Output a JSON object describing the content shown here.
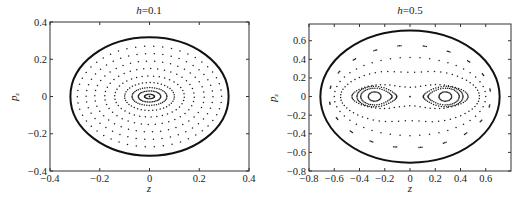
{
  "chart_data": [
    {
      "type": "scatter",
      "title": "h=0.1",
      "title_prefix": "h",
      "title_value": "=0.1",
      "xlabel": "z",
      "ylabel": "p_z",
      "xlim": [
        -0.4,
        0.4
      ],
      "ylim": [
        -0.4,
        0.4
      ],
      "xticks": [
        -0.4,
        -0.2,
        0,
        0.2,
        0.4
      ],
      "xtick_labels": [
        "−0.4",
        "−0.2",
        "0",
        "0.2",
        "0.4"
      ],
      "yticks": [
        -0.4,
        -0.2,
        0,
        0.2,
        0.4
      ],
      "ytick_labels": [
        "−0.4",
        "−0.2",
        "0",
        "0.2",
        "0.4"
      ],
      "grid": false,
      "legend": null,
      "frame_px": {
        "x0": 50,
        "y0": 22,
        "x1": 249,
        "y1": 171
      },
      "boundary": {
        "cz": 0,
        "cp": 0,
        "rz": 0.318,
        "rp": 0.318
      },
      "orbits": [
        {
          "kind": "ring",
          "cz": 0,
          "cp": 0,
          "rz": 0.02,
          "rp": 0.012,
          "n": 24
        },
        {
          "kind": "ring",
          "cz": 0,
          "cp": 0,
          "rz": 0.045,
          "rp": 0.03,
          "n": 40
        },
        {
          "kind": "ring",
          "cz": 0,
          "cp": 0,
          "rz": 0.07,
          "rp": 0.048,
          "n": 44
        },
        {
          "kind": "ring",
          "cz": 0,
          "cp": 0,
          "rz": 0.1,
          "rp": 0.075,
          "n": 40
        },
        {
          "kind": "ring",
          "cz": 0,
          "cp": 0,
          "rz": 0.14,
          "rp": 0.11,
          "n": 38
        },
        {
          "kind": "ring",
          "cz": 0,
          "cp": 0,
          "rz": 0.18,
          "rp": 0.15,
          "n": 40
        },
        {
          "kind": "ring",
          "cz": 0,
          "cp": 0,
          "rz": 0.22,
          "rp": 0.19,
          "n": 42
        },
        {
          "kind": "ring",
          "cz": 0,
          "cp": 0,
          "rz": 0.255,
          "rp": 0.23,
          "n": 46
        },
        {
          "kind": "ring",
          "cz": 0,
          "cp": 0,
          "rz": 0.29,
          "rp": 0.27,
          "n": 50
        }
      ],
      "center_point": {
        "z": 0,
        "p": 0
      }
    },
    {
      "type": "scatter",
      "title": "h=0.5",
      "title_prefix": "h",
      "title_value": "=0.5",
      "xlabel": "z",
      "ylabel": "p_z",
      "xlim": [
        -0.8,
        0.8
      ],
      "ylim": [
        -0.8,
        0.78
      ],
      "xticks": [
        -0.8,
        -0.6,
        -0.4,
        -0.2,
        0,
        0.2,
        0.4,
        0.6
      ],
      "xtick_labels": [
        "−0.8",
        "−0.6",
        "−0.4",
        "−0.2",
        "0",
        "0.2",
        "0.4",
        "0.6"
      ],
      "yticks": [
        -0.8,
        -0.6,
        -0.4,
        -0.2,
        0,
        0.2,
        0.4,
        0.6
      ],
      "ytick_labels": [
        "−0.8",
        "−0.6",
        "−0.4",
        "−0.2",
        "0",
        "0.2",
        "0.4",
        "0.6"
      ],
      "grid": false,
      "legend": null,
      "frame_px": {
        "x0": 309,
        "y0": 24,
        "x1": 511,
        "y1": 171
      },
      "boundary": {
        "cz": 0,
        "cp": 0,
        "rz": 0.71,
        "rp": 0.71
      },
      "orbits": [
        {
          "kind": "ring",
          "cz": -0.28,
          "cp": 0,
          "rz": 0.05,
          "rp": 0.05,
          "n": 30
        },
        {
          "kind": "ring",
          "cz": 0.28,
          "cp": 0,
          "rz": 0.05,
          "rp": 0.05,
          "n": 30
        },
        {
          "kind": "island",
          "cz": -0.28,
          "cp": 0,
          "rz": 0.11,
          "rp": 0.09,
          "n": 44
        },
        {
          "kind": "island",
          "cz": 0.28,
          "cp": 0,
          "rz": 0.11,
          "rp": 0.09,
          "n": 44,
          "mirror": true
        },
        {
          "kind": "island",
          "cz": -0.28,
          "cp": 0,
          "rz": 0.14,
          "rp": 0.11,
          "n": 50
        },
        {
          "kind": "island",
          "cz": 0.28,
          "cp": 0,
          "rz": 0.14,
          "rp": 0.11,
          "n": 50,
          "mirror": true
        },
        {
          "kind": "dumbbell",
          "rz": 0.46,
          "rp": 0.16,
          "waist": 0.1,
          "n": 70
        },
        {
          "kind": "dumbbell",
          "rz": 0.55,
          "rp": 0.3,
          "waist": 0.26,
          "n": 64
        },
        {
          "kind": "ring",
          "cz": 0,
          "cp": 0,
          "rz": 0.6,
          "rp": 0.42,
          "n": 48
        },
        {
          "kind": "dashed",
          "cz": 0,
          "cp": 0,
          "rz": 0.64,
          "rp": 0.55,
          "n": 20
        }
      ],
      "center_point": {
        "z": 0,
        "p": 0
      }
    }
  ]
}
